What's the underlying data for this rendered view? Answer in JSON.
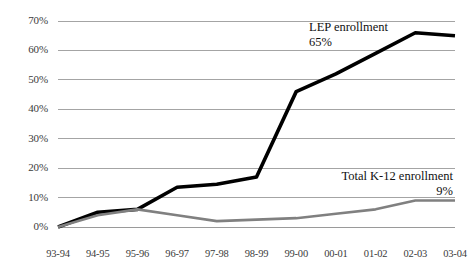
{
  "chart_data": {
    "type": "line",
    "title": "",
    "xlabel": "",
    "ylabel": "",
    "categories": [
      "93-94",
      "94-95",
      "95-96",
      "96-97",
      "97-98",
      "98-99",
      "99-00",
      "00-01",
      "01-02",
      "02-03",
      "03-04"
    ],
    "ylim": [
      0,
      70
    ],
    "ytick_labels": [
      "0%",
      "10%",
      "20%",
      "30%",
      "40%",
      "50%",
      "60%",
      "70%"
    ],
    "ytick_values": [
      0,
      10,
      20,
      30,
      40,
      50,
      60,
      70
    ],
    "grid": "horizontal",
    "legend_position": "inline-annotations",
    "series": [
      {
        "name": "LEP enrollment",
        "color": "#000000",
        "values": [
          0,
          5,
          6,
          13.5,
          14.5,
          17,
          46,
          52,
          59,
          66,
          65
        ]
      },
      {
        "name": "Total K-12 enrollment",
        "color": "#808080",
        "values": [
          0,
          4,
          6,
          4,
          2,
          2.5,
          3,
          4.5,
          6,
          9,
          9
        ]
      }
    ],
    "annotations": [
      {
        "label": "LEP enrollment",
        "value": "65%",
        "series": "LEP enrollment",
        "align": "left"
      },
      {
        "label": "Total K-12 enrollment",
        "value": "9%",
        "series": "Total K-12 enrollment",
        "align": "right"
      }
    ]
  },
  "colors": {
    "lep_line": "#000000",
    "total_line": "#808080",
    "gridline": "#9a9a9a",
    "tick_text": "#3b3b3b",
    "annotation_text": "#111111",
    "background": "#ffffff"
  }
}
